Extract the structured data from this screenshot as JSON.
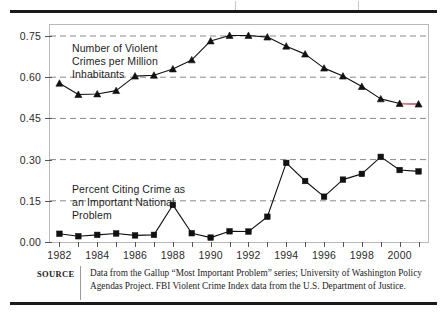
{
  "figure": {
    "source_label": "SOURCE",
    "source_text": "Data from the Gallup “Most Important Problem” series; University of Washington Policy Agendas Project. FBI Violent Crime Index data from the U.S. Department of Justice."
  },
  "chart_data": {
    "type": "line",
    "title": "",
    "xlabel": "",
    "ylabel": "",
    "xlim": [
      1981.5,
      2001.5
    ],
    "ylim": [
      0.0,
      0.79
    ],
    "grid": "horizontal-dashed",
    "legend": "inline-annotations",
    "x": [
      1982,
      1983,
      1984,
      1985,
      1986,
      1987,
      1988,
      1989,
      1990,
      1991,
      1992,
      1993,
      1994,
      1995,
      1996,
      1997,
      1998,
      1999,
      2000,
      2001
    ],
    "xticks": [
      1982,
      1983,
      1984,
      1985,
      1986,
      1987,
      1988,
      1989,
      1990,
      1991,
      1992,
      1993,
      1994,
      1995,
      1996,
      1997,
      1998,
      1999,
      2000,
      2001
    ],
    "xticklabels": [
      "1982",
      "",
      "1984",
      "",
      "1986",
      "",
      "1988",
      "",
      "1990",
      "",
      "1992",
      "",
      "1994",
      "",
      "1996",
      "",
      "1998",
      "",
      "2000",
      ""
    ],
    "yticks": [
      0.0,
      0.15,
      0.3,
      0.45,
      0.6,
      0.75
    ],
    "yticklabels": [
      "0.00",
      "0.15",
      "0.30",
      "0.45",
      "0.60",
      "0.75"
    ],
    "series": [
      {
        "name": "Number of Violent Crimes per Million Inhabitants",
        "annotation": "Number of Violent\nCrimes per Million\nInhabitants",
        "marker": "triangle",
        "color": "#111111",
        "highlight_color": "#e8737f",
        "highlight_segment": [
          2000,
          2001
        ],
        "values": [
          0.578,
          0.537,
          0.539,
          0.551,
          0.604,
          0.607,
          0.63,
          0.663,
          0.732,
          0.752,
          0.752,
          0.746,
          0.713,
          0.684,
          0.633,
          0.604,
          0.566,
          0.521,
          0.504,
          0.502
        ]
      },
      {
        "name": "Percent Citing Crime as an Important National Problem",
        "annotation": "Percent Citing Crime as\nan Important National\nProblem",
        "marker": "square",
        "color": "#111111",
        "values": [
          0.03,
          0.021,
          0.026,
          0.031,
          0.024,
          0.026,
          0.135,
          0.032,
          0.016,
          0.039,
          0.038,
          0.092,
          0.288,
          0.222,
          0.165,
          0.227,
          0.248,
          0.31,
          0.262,
          0.257
        ]
      }
    ]
  }
}
